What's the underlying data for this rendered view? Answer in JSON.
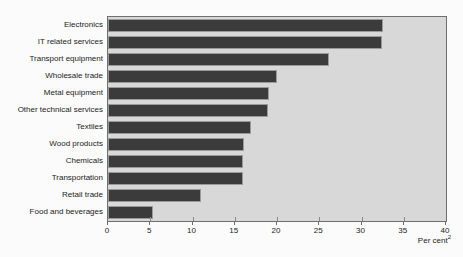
{
  "chart_data": {
    "type": "bar",
    "orientation": "horizontal",
    "title": "",
    "subtitle": "",
    "xlabel": "Per cent",
    "xlabel_superscript": "2",
    "ylabel": "",
    "xlim": [
      0,
      40
    ],
    "xticks": [
      0,
      5,
      10,
      15,
      20,
      25,
      30,
      35,
      40
    ],
    "xtick_labels": [
      "0",
      "5",
      "10",
      "15",
      "20",
      "25",
      "30",
      "35",
      "40"
    ],
    "grid": false,
    "legend": null,
    "bar_color": "#3b3b3b",
    "plot_background": "#d8d8d8",
    "page_background": "#fbfbfb",
    "categories": [
      "Electronics",
      "IT related services",
      "Transport equipment",
      "Wholesale trade",
      "Metal equipment",
      "Other technical services",
      "Textiles",
      "Wood products",
      "Chemicals",
      "Transportation",
      "Retail trade",
      "Food and beverages"
    ],
    "values": [
      32.5,
      32.4,
      26.2,
      20.0,
      19.0,
      18.9,
      16.9,
      16.1,
      16.0,
      16.0,
      11.0,
      5.3
    ]
  }
}
